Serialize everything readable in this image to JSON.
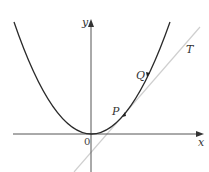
{
  "diagram": {
    "axes": {
      "x_label": "x",
      "y_label": "y",
      "origin_label": "0"
    },
    "curve": {
      "type": "parabola",
      "equation": "y = x^2",
      "color": "#2a2a2a"
    },
    "points": [
      {
        "id": "P",
        "label": "P",
        "px": 123,
        "py": 116
      },
      {
        "id": "Q",
        "label": "Q",
        "px": 147,
        "py": 75
      }
    ],
    "tangent": {
      "label": "T",
      "color": "#c8c8c8",
      "through": "P"
    },
    "colors": {
      "axis": "#555555",
      "curve": "#2a2a2a",
      "tangent": "#c8c8c8",
      "text": "#333333"
    }
  }
}
